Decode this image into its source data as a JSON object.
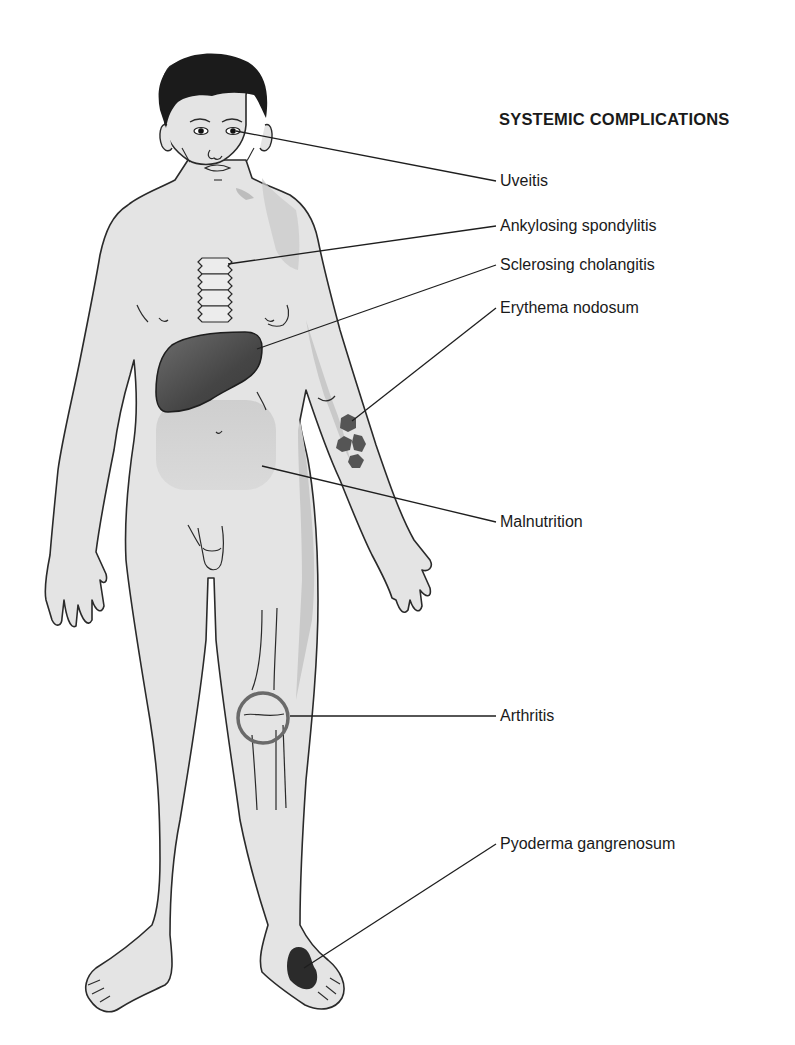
{
  "title": "SYSTEMIC COMPLICATIONS",
  "labels": [
    {
      "text": "Uveitis",
      "target": "eye",
      "top": 171
    },
    {
      "text": "Ankylosing spondylitis",
      "target": "spine",
      "top": 216
    },
    {
      "text": "Sclerosing cholangitis",
      "target": "liver",
      "top": 255
    },
    {
      "text": "Erythema nodosum",
      "target": "forearm",
      "top": 298
    },
    {
      "text": "Malnutrition",
      "target": "abdomen",
      "top": 512
    },
    {
      "text": "Arthritis",
      "target": "knee",
      "top": 706
    },
    {
      "text": "Pyoderma gangrenosum",
      "target": "foot",
      "top": 834
    }
  ],
  "colors": {
    "skin": "#e4e4e4",
    "skin_shadow": "#c9c9c9",
    "outline": "#2a2a2a",
    "hair": "#1b1b1b",
    "liver": "#4a4a4a",
    "lesion": "#555555",
    "pyoderma": "#2b2b2b",
    "knee_circle": "#6a6a6a",
    "abdomen_shade": "#cfcfcf"
  }
}
